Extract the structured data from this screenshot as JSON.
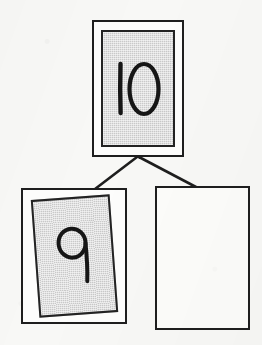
{
  "scene": {
    "kind": "handwritten-binary-tree-diagram",
    "background_color": "#f8f8f6",
    "ink_color": "#1e1e1e",
    "card_fill_color": "#c9c9c9",
    "empty_card_fill_color": "#fcfcfa",
    "width": 262,
    "height": 345
  },
  "nodes": {
    "root": {
      "value": "10",
      "filled": "true",
      "x": 92,
      "y": 20,
      "width": 92,
      "height": 137
    },
    "left_child": {
      "value": "9",
      "filled": "true",
      "x": 21,
      "y": 188,
      "width": 106,
      "height": 136,
      "rotation_deg": "-4.2"
    },
    "right_child": {
      "value": "",
      "filled": "false",
      "x": 155,
      "y": 186,
      "width": 95,
      "height": 144
    }
  },
  "edges": [
    {
      "name": "root-to-left-child",
      "x1": 137,
      "y1": 157,
      "x2": 95,
      "y2": 189
    },
    {
      "name": "root-to-right-child",
      "x1": 139,
      "y1": 157,
      "x2": 196,
      "y2": 187
    }
  ]
}
